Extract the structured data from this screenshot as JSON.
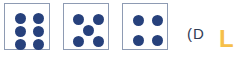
{
  "background_color": "#ffffff",
  "colors": {
    "pip": "#27417c",
    "die_border": "#8e9bb3",
    "die_face": "#ffffff",
    "caption_text": "#2f3b54",
    "accent_yellow": "#f6bf4a"
  },
  "dice": [
    {
      "name": "die-six",
      "value": 6,
      "pip_count": 6,
      "layout": "two-columns-of-three"
    },
    {
      "name": "die-five",
      "value": 5,
      "pip_count": 5,
      "layout": "four-corners-plus-center"
    },
    {
      "name": "die-four",
      "value": 4,
      "pip_count": 4,
      "layout": "four-corners"
    }
  ],
  "caption": {
    "fragment": "(D"
  },
  "accent": {
    "glyph": "L"
  }
}
